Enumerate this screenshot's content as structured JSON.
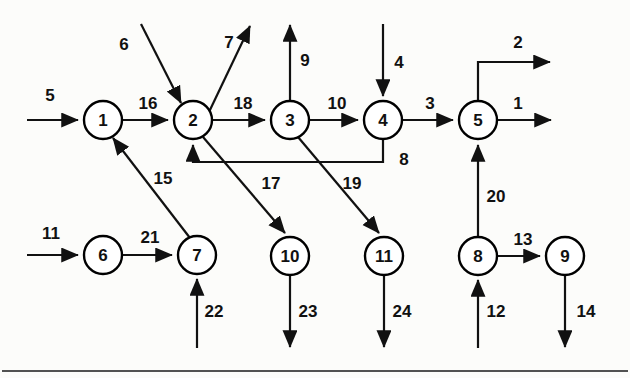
{
  "diagram": {
    "canvas": {
      "width": 630,
      "height": 378
    },
    "style": {
      "background": "#fcfcfa",
      "line_color": "#111111",
      "node_fill": "#ffffff",
      "node_stroke": "#000000",
      "node_radius": 19
    },
    "nodes": [
      {
        "id": "1",
        "label": "1",
        "cx": 103,
        "cy": 120
      },
      {
        "id": "2",
        "label": "2",
        "cx": 193,
        "cy": 120
      },
      {
        "id": "3",
        "label": "3",
        "cx": 290,
        "cy": 120
      },
      {
        "id": "4",
        "label": "4",
        "cx": 383,
        "cy": 120
      },
      {
        "id": "5",
        "label": "5",
        "cx": 478,
        "cy": 120
      },
      {
        "id": "6",
        "label": "6",
        "cx": 103,
        "cy": 255
      },
      {
        "id": "7",
        "label": "7",
        "cx": 197,
        "cy": 255
      },
      {
        "id": "8",
        "label": "8",
        "cx": 478,
        "cy": 256
      },
      {
        "id": "9",
        "label": "9",
        "cx": 565,
        "cy": 256
      },
      {
        "id": "10",
        "label": "10",
        "cx": 290,
        "cy": 256
      },
      {
        "id": "11",
        "label": "11",
        "cx": 384,
        "cy": 256
      }
    ],
    "arcs": [
      {
        "id": "a5",
        "label": "5",
        "from": "source",
        "to": "1",
        "label_x": 50,
        "label_y": 95,
        "kind": "external-in"
      },
      {
        "id": "a16",
        "label": "16",
        "from": "1",
        "to": "2",
        "label_x": 148,
        "label_y": 103,
        "kind": "internal"
      },
      {
        "id": "a6",
        "label": "6",
        "from": "source",
        "to": "2",
        "label_x": 124,
        "label_y": 44,
        "kind": "external-in"
      },
      {
        "id": "a7",
        "label": "7",
        "from": "2",
        "to": "sink",
        "label_x": 229,
        "label_y": 42,
        "kind": "external-out"
      },
      {
        "id": "a18",
        "label": "18",
        "from": "2",
        "to": "3",
        "label_x": 243,
        "label_y": 103,
        "kind": "internal"
      },
      {
        "id": "a9",
        "label": "9",
        "from": "3",
        "to": "sink",
        "label_x": 305,
        "label_y": 60,
        "kind": "external-out"
      },
      {
        "id": "a10",
        "label": "10",
        "from": "3",
        "to": "4",
        "label_x": 337,
        "label_y": 103,
        "kind": "internal"
      },
      {
        "id": "a4",
        "label": "4",
        "from": "source",
        "to": "4",
        "label_x": 399,
        "label_y": 62,
        "kind": "external-in"
      },
      {
        "id": "a3",
        "label": "3",
        "from": "4",
        "to": "5",
        "label_x": 430,
        "label_y": 103,
        "kind": "internal"
      },
      {
        "id": "a2",
        "label": "2",
        "from": "5",
        "to": "sink",
        "label_x": 518,
        "label_y": 42,
        "kind": "external-out"
      },
      {
        "id": "a1",
        "label": "1",
        "from": "5",
        "to": "sink",
        "label_x": 518,
        "label_y": 103,
        "kind": "external-out"
      },
      {
        "id": "a8",
        "label": "8",
        "from": "4",
        "to": "2",
        "label_x": 404,
        "label_y": 159,
        "kind": "feedback"
      },
      {
        "id": "a15",
        "label": "15",
        "from": "7",
        "to": "1",
        "label_x": 163,
        "label_y": 178,
        "kind": "internal"
      },
      {
        "id": "a17",
        "label": "17",
        "from": "2",
        "to": "10",
        "label_x": 271,
        "label_y": 183,
        "kind": "internal"
      },
      {
        "id": "a19",
        "label": "19",
        "from": "3",
        "to": "11",
        "label_x": 352,
        "label_y": 183,
        "kind": "internal"
      },
      {
        "id": "a11",
        "label": "11",
        "from": "source",
        "to": "6",
        "label_x": 51,
        "label_y": 233,
        "kind": "external-in"
      },
      {
        "id": "a21",
        "label": "21",
        "from": "6",
        "to": "7",
        "label_x": 150,
        "label_y": 237,
        "kind": "internal"
      },
      {
        "id": "a22",
        "label": "22",
        "from": "source",
        "to": "7",
        "label_x": 214,
        "label_y": 311,
        "kind": "external-in"
      },
      {
        "id": "a23",
        "label": "23",
        "from": "10",
        "to": "sink",
        "label_x": 308,
        "label_y": 311,
        "kind": "external-out"
      },
      {
        "id": "a24",
        "label": "24",
        "from": "11",
        "to": "sink",
        "label_x": 402,
        "label_y": 311,
        "kind": "external-out"
      },
      {
        "id": "a20",
        "label": "20",
        "from": "8",
        "to": "5",
        "label_x": 496,
        "label_y": 196,
        "kind": "internal"
      },
      {
        "id": "a13",
        "label": "13",
        "from": "8",
        "to": "9",
        "label_x": 523,
        "label_y": 239,
        "kind": "internal"
      },
      {
        "id": "a12",
        "label": "12",
        "from": "source",
        "to": "8",
        "label_x": 496,
        "label_y": 311,
        "kind": "external-in"
      },
      {
        "id": "a14",
        "label": "14",
        "from": "9",
        "to": "sink",
        "label_x": 586,
        "label_y": 311,
        "kind": "external-out"
      }
    ],
    "footer_rule": {
      "y": 371,
      "from_x": 2,
      "to_x": 628
    }
  }
}
